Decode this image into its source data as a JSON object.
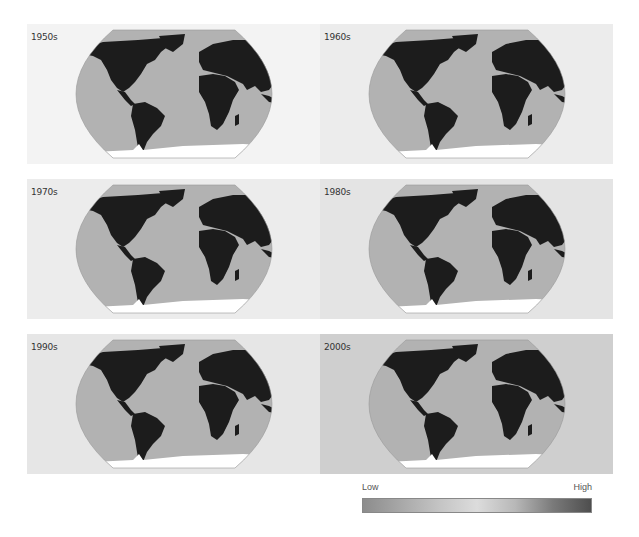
{
  "chart_data": {
    "type": "heatmap",
    "title": "",
    "panels": [
      {
        "label": "1950s",
        "row": 0,
        "col": 0,
        "background": "#f3f3f3"
      },
      {
        "label": "1960s",
        "row": 0,
        "col": 1,
        "background": "#ececec"
      },
      {
        "label": "1970s",
        "row": 1,
        "col": 0,
        "background": "#ececec"
      },
      {
        "label": "1980s",
        "row": 1,
        "col": 1,
        "background": "#e4e4e4"
      },
      {
        "label": "1990s",
        "row": 2,
        "col": 0,
        "background": "#e6e6e6"
      },
      {
        "label": "2000s",
        "row": 2,
        "col": 1,
        "background": "#cfcfcf"
      }
    ],
    "legend": {
      "low_label": "Low",
      "high_label": "High",
      "gradient": [
        "#8c8c8c",
        "#a8a8a8",
        "#c4c4c4",
        "#dcdcdc",
        "#b8b8b8",
        "#7a7a7a",
        "#4e4e4e"
      ]
    },
    "colors": {
      "ocean": "#b2b2b2",
      "land": "#1c1c1c",
      "antarctica": "#ffffff",
      "hotspot": "#e2e2e2"
    }
  },
  "legend": {
    "low": "Low",
    "high": "High"
  }
}
